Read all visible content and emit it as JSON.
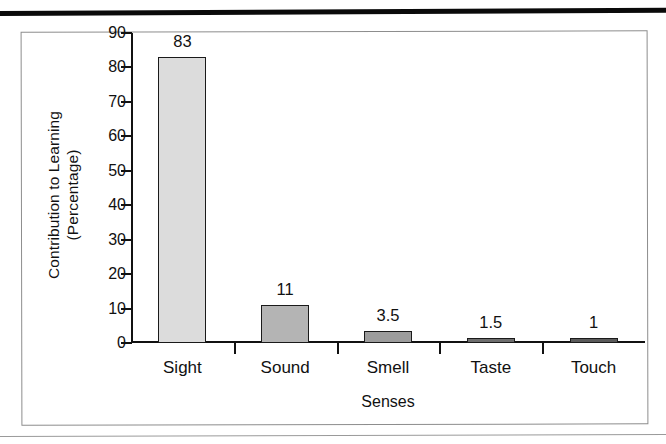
{
  "chart_data": {
    "type": "bar",
    "title": "",
    "categories": [
      "Sight",
      "Sound",
      "Smell",
      "Taste",
      "Touch"
    ],
    "values": [
      83,
      11,
      3.5,
      1.5,
      1
    ],
    "value_labels": [
      "83",
      "11",
      "3.5",
      "1.5",
      "1"
    ],
    "xlabel": "Senses",
    "ylabel_line1": "Contribution to Learning",
    "ylabel_line2": "(Percentage)",
    "ylim": [
      0,
      90
    ],
    "ytick_values": [
      0,
      10,
      20,
      30,
      40,
      50,
      60,
      70,
      80,
      90
    ],
    "ytick_labels": [
      "0",
      "10",
      "20",
      "30",
      "40",
      "50",
      "60",
      "70",
      "80",
      "90"
    ],
    "grid": false,
    "legend": "none",
    "bar_colors": [
      "#dcdcdc",
      "#b4b4b4",
      "#9c9c9c",
      "#6e6e6e",
      "#5a5a5a"
    ],
    "bar_border_color": "#1a1a1a",
    "axis_color": "#111111",
    "frame_color": "#8d8d8d",
    "background": "#ffffff"
  }
}
